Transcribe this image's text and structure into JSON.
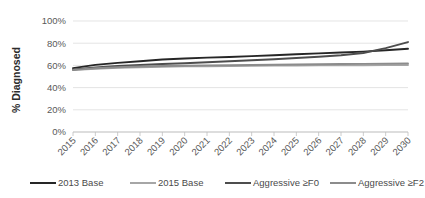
{
  "chart_data": {
    "type": "line",
    "title": "",
    "xlabel": "",
    "ylabel": "% Diagnosed",
    "ylim": [
      0,
      100
    ],
    "ytick_labels": [
      "0%",
      "20%",
      "40%",
      "60%",
      "80%",
      "100%"
    ],
    "ytick_values": [
      0,
      20,
      40,
      60,
      80,
      100
    ],
    "grid": true,
    "legend_position": "bottom",
    "categories": [
      "2015",
      "2016",
      "2017",
      "2018",
      "2019",
      "2020",
      "2021",
      "2022",
      "2023",
      "2024",
      "2025",
      "2026",
      "2027",
      "2028",
      "2029",
      "2030"
    ],
    "series": [
      {
        "name": "2013 Base",
        "color": "#262626",
        "width": 1.9,
        "values": [
          57.5,
          60.5,
          62.3,
          63.8,
          65.3,
          66.2,
          67.0,
          67.6,
          68.4,
          69.2,
          70.0,
          70.8,
          71.6,
          72.4,
          73.6,
          75.0
        ]
      },
      {
        "name": "2015 Base",
        "color": "#a6a6a6",
        "width": 1.9,
        "values": [
          55.8,
          57.0,
          57.8,
          58.3,
          58.8,
          59.1,
          59.3,
          59.5,
          59.7,
          59.8,
          59.9,
          60.0,
          60.1,
          60.2,
          60.3,
          60.4
        ]
      },
      {
        "name": "Aggressive ≥F0",
        "color": "#4d4d4d",
        "width": 1.9,
        "values": [
          56.3,
          58.2,
          59.5,
          60.4,
          61.2,
          62.0,
          62.8,
          63.7,
          64.6,
          65.6,
          66.6,
          67.8,
          69.2,
          71.2,
          75.5,
          81.0
        ]
      },
      {
        "name": "Aggressive ≥F2",
        "color": "#8c8c8c",
        "width": 1.9,
        "values": [
          56.0,
          57.5,
          58.4,
          59.0,
          59.4,
          59.7,
          60.0,
          60.2,
          60.4,
          60.6,
          60.8,
          61.0,
          61.2,
          61.4,
          61.6,
          61.8
        ]
      }
    ]
  },
  "legend": {
    "items": [
      {
        "label": "2013 Base",
        "color": "#262626"
      },
      {
        "label": "2015 Base",
        "color": "#a6a6a6"
      },
      {
        "label": "Aggressive ≥F0",
        "color": "#4d4d4d"
      },
      {
        "label": "Aggressive ≥F2",
        "color": "#8c8c8c"
      }
    ]
  }
}
